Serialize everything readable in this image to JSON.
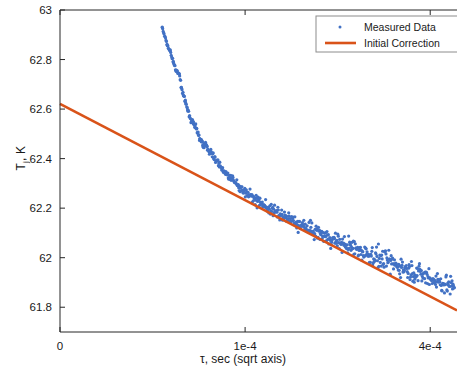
{
  "chart_data": {
    "type": "scatter",
    "title": "",
    "xlabel": "τ, sec (sqrt axis)",
    "ylabel_html": "T<sub>j</sub>, K",
    "ylabel": "T_j, K",
    "x_scale": "sqrt",
    "xlim": [
      0,
      0.00046
    ],
    "ylim": [
      61.7,
      63.0
    ],
    "xticks": [
      0,
      0.0001,
      0.0004
    ],
    "xticklabels": [
      "0",
      "1e-4",
      "4e-4"
    ],
    "yticks": [
      61.8,
      62.0,
      62.2,
      62.4,
      62.6,
      62.8,
      63.0
    ],
    "yticklabels": [
      "61.8",
      "62",
      "62.2",
      "62.4",
      "62.6",
      "62.8",
      "63"
    ],
    "grid": false,
    "legend": {
      "position": "top-right",
      "entries": [
        {
          "label": "Measured Data",
          "marker": "point",
          "color": "#4271c4"
        },
        {
          "label": "Initial Correction",
          "marker": "line",
          "color": "#d95319"
        }
      ]
    },
    "series": [
      {
        "name": "Measured Data",
        "type": "scatter",
        "color": "#4271c4",
        "marker_size": 1.6,
        "comment": "T_j vs tau; steep transient decay then near-linear-in-sqrt(tau) tail with noise",
        "points": [
          [
            3.05e-05,
            62.929
          ],
          [
            3.35e-05,
            62.861
          ],
          [
            3.55e-05,
            62.833
          ],
          [
            3.75e-05,
            62.793
          ],
          [
            3.95e-05,
            62.757
          ],
          [
            4.15e-05,
            62.742
          ],
          [
            4.3e-05,
            62.688
          ],
          [
            4.45e-05,
            62.655
          ],
          [
            4.6e-05,
            62.627
          ],
          [
            4.75e-05,
            62.597
          ],
          [
            4.9e-05,
            62.573
          ],
          [
            5.05e-05,
            62.551
          ],
          [
            5.2e-05,
            62.548
          ],
          [
            5.32e-05,
            62.533
          ],
          [
            5.45e-05,
            62.52
          ],
          [
            5.58e-05,
            62.497
          ],
          [
            5.7e-05,
            62.481
          ],
          [
            5.82e-05,
            62.468
          ],
          [
            5.95e-05,
            62.455
          ],
          [
            6.05e-05,
            62.444
          ],
          [
            6.18e-05,
            62.466
          ],
          [
            6.3e-05,
            62.447
          ],
          [
            6.42e-05,
            62.437
          ],
          [
            6.55e-05,
            62.424
          ],
          [
            6.68e-05,
            62.433
          ],
          [
            6.8e-05,
            62.412
          ],
          [
            6.92e-05,
            62.401
          ],
          [
            7.05e-05,
            62.396
          ],
          [
            7.18e-05,
            62.389
          ],
          [
            7.3e-05,
            62.38
          ],
          [
            7.45e-05,
            62.375
          ],
          [
            7.6e-05,
            62.364
          ],
          [
            7.75e-05,
            62.357
          ],
          [
            7.9e-05,
            62.349
          ],
          [
            8.05e-05,
            62.342
          ],
          [
            8.2e-05,
            62.334
          ],
          [
            8.35e-05,
            62.327
          ],
          [
            8.5e-05,
            62.32
          ],
          [
            8.7e-05,
            62.314
          ],
          [
            8.9e-05,
            62.306
          ],
          [
            9.1e-05,
            62.298
          ],
          [
            9.3e-05,
            62.291
          ],
          [
            9.5e-05,
            62.284
          ],
          [
            9.7e-05,
            62.277
          ],
          [
            9.9e-05,
            62.27
          ],
          [
            0.000101,
            62.263
          ],
          [
            0.000104,
            62.256
          ],
          [
            0.000106,
            62.249
          ],
          [
            0.000109,
            62.242
          ],
          [
            0.000111,
            62.235
          ],
          [
            0.000114,
            62.229
          ],
          [
            0.000117,
            62.222
          ],
          [
            0.00012,
            62.215
          ],
          [
            0.000123,
            62.209
          ],
          [
            0.000126,
            62.202
          ],
          [
            0.000129,
            62.196
          ],
          [
            0.000132,
            62.19
          ],
          [
            0.000136,
            62.183
          ],
          [
            0.000139,
            62.177
          ],
          [
            0.000143,
            62.171
          ],
          [
            0.000147,
            62.164
          ],
          [
            0.000151,
            62.158
          ],
          [
            0.000155,
            62.152
          ],
          [
            0.000159,
            62.146
          ],
          [
            0.000163,
            62.14
          ],
          [
            0.000167,
            62.134
          ],
          [
            0.000172,
            62.127
          ],
          [
            0.000176,
            62.121
          ],
          [
            0.000181,
            62.115
          ],
          [
            0.000186,
            62.109
          ],
          [
            0.000191,
            62.103
          ],
          [
            0.000196,
            62.097
          ],
          [
            0.000201,
            62.091
          ],
          [
            0.000206,
            62.085
          ],
          [
            0.000212,
            62.079
          ],
          [
            0.000218,
            62.073
          ],
          [
            0.000223,
            62.067
          ],
          [
            0.000229,
            62.061
          ],
          [
            0.000235,
            62.055
          ],
          [
            0.000242,
            62.048
          ],
          [
            0.000248,
            62.042
          ],
          [
            0.000255,
            62.036
          ],
          [
            0.000261,
            62.03
          ],
          [
            0.000268,
            62.024
          ],
          [
            0.000275,
            62.017
          ],
          [
            0.000282,
            62.011
          ],
          [
            0.00029,
            62.005
          ],
          [
            0.000297,
            61.998
          ],
          [
            0.000305,
            61.992
          ],
          [
            0.000313,
            61.985
          ],
          [
            0.000321,
            61.979
          ],
          [
            0.000329,
            61.972
          ],
          [
            0.000337,
            61.966
          ],
          [
            0.000346,
            61.959
          ],
          [
            0.000355,
            61.952
          ],
          [
            0.000364,
            61.945
          ],
          [
            0.000373,
            61.938
          ],
          [
            0.000382,
            61.931
          ],
          [
            0.000392,
            61.924
          ],
          [
            0.000402,
            61.917
          ],
          [
            0.000412,
            61.909
          ],
          [
            0.000422,
            61.902
          ],
          [
            0.000432,
            61.894
          ],
          [
            0.000443,
            61.886
          ],
          [
            0.000454,
            61.878
          ]
        ],
        "noise_amplitude": 0.022,
        "n_points": 620
      },
      {
        "name": "Initial Correction",
        "type": "line",
        "color": "#d95319",
        "linewidth": 2.6,
        "endpoints": [
          [
            0,
            62.621
          ],
          [
            0.00046,
            61.787
          ]
        ]
      }
    ]
  },
  "axes": {
    "box_color": "#262626",
    "background": "#ffffff",
    "tick_direction": "in"
  }
}
